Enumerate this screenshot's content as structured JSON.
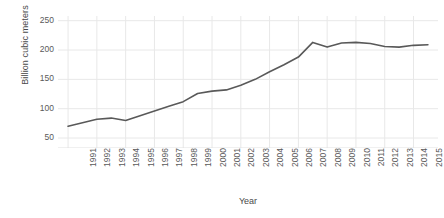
{
  "chart_data": {
    "type": "line",
    "title": "",
    "xlabel": "Year",
    "ylabel": "Billion cubic meters",
    "xlim": [
      1990.3,
      2016.7
    ],
    "ylim": [
      33,
      258
    ],
    "yticks": [
      50,
      100,
      150,
      200,
      250
    ],
    "ytick_labels": [
      "50",
      "100",
      "150",
      "200",
      "250"
    ],
    "grid": true,
    "grid_color": "#e8e8e8",
    "legend": false,
    "legend_position": "none",
    "line_color": "#595959",
    "line_width": 1.6,
    "markers": false,
    "x": [
      1991,
      1992,
      1993,
      1994,
      1995,
      1996,
      1997,
      1998,
      1999,
      2000,
      2001,
      2002,
      2003,
      2004,
      2005,
      2006,
      2007,
      2008,
      2009,
      2010,
      2011,
      2012,
      2013,
      2014,
      2015,
      2016
    ],
    "categories": [
      "1991",
      "1992",
      "1993",
      "1994",
      "1995",
      "1996",
      "1997",
      "1998",
      "1999",
      "2000",
      "2001",
      "2002",
      "2003",
      "2004",
      "2005",
      "2006",
      "2007",
      "2008",
      "2009",
      "2010",
      "2011",
      "2012",
      "2013",
      "2014",
      "2015",
      "2016"
    ],
    "values": [
      70,
      76,
      82,
      84,
      80,
      88,
      96,
      104,
      112,
      126,
      130,
      132,
      140,
      150,
      163,
      175,
      188,
      213,
      205,
      212,
      213,
      211,
      206,
      205,
      208,
      209
    ],
    "series": [
      {
        "name": "Billion cubic meters",
        "values": [
          70,
          76,
          82,
          84,
          80,
          88,
          96,
          104,
          112,
          126,
          130,
          132,
          140,
          150,
          163,
          175,
          188,
          213,
          205,
          212,
          213,
          211,
          206,
          205,
          208,
          209
        ]
      }
    ]
  }
}
